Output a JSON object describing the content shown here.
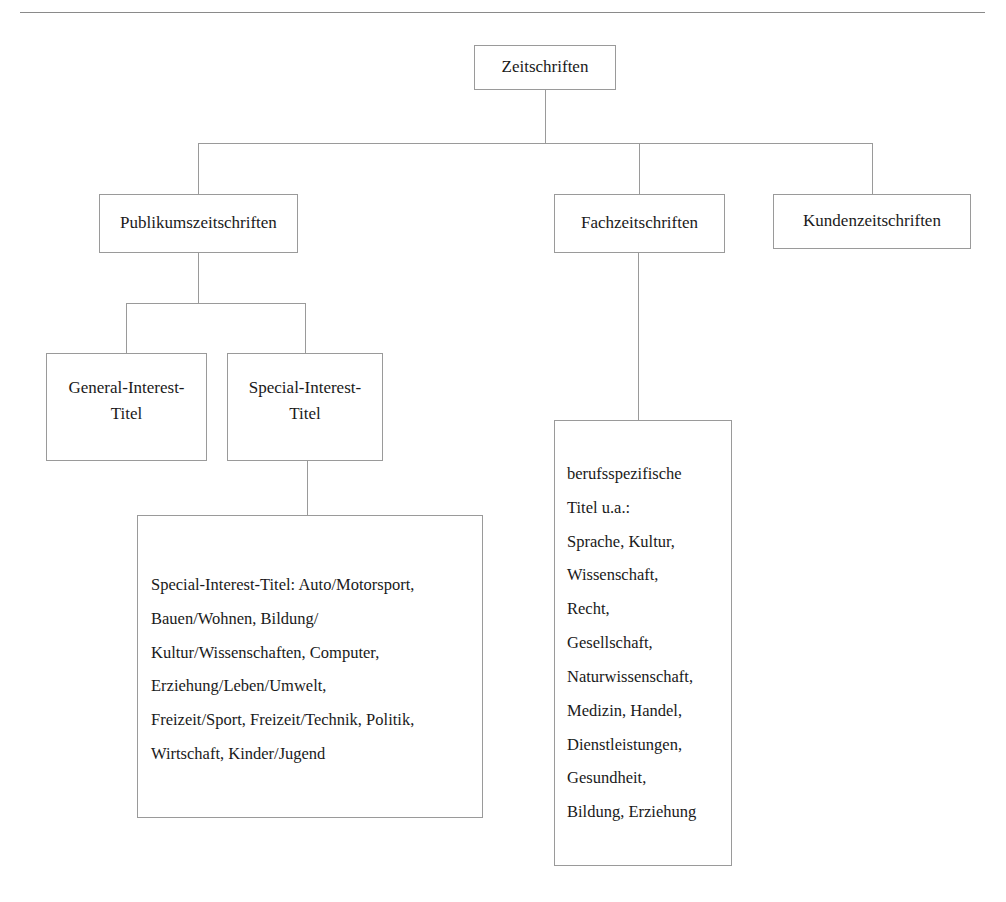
{
  "diagram": {
    "title_node": "Zeitschriften",
    "nodes": {
      "root": {
        "label": "Zeitschriften"
      },
      "publikum": {
        "label": "Publikumszeitschriften"
      },
      "fach": {
        "label": "Fachzeitschriften"
      },
      "kunden": {
        "label": "Kundenzeitschriften"
      },
      "general_interest": {
        "line1": "General-Interest-",
        "line2": "Titel"
      },
      "special_interest": {
        "line1": "Special-Interest-",
        "line2": "Titel"
      },
      "special_interest_detail": {
        "lines": [
          "Special-Interest-Titel: Auto/Motorsport,",
          "Bauen/Wohnen, Bildung/",
          "Kultur/Wissenschaften, Computer,",
          "Erziehung/Leben/Umwelt,",
          "Freizeit/Sport, Freizeit/Technik, Politik,",
          "Wirtschaft, Kinder/Jugend"
        ]
      },
      "fach_detail": {
        "lines": [
          "berufsspezifische",
          "Titel u.a.:",
          "Sprache, Kultur,",
          "Wissenschaft,",
          "Recht,",
          "Gesellschaft,",
          "Naturwissenschaft,",
          "Medizin, Handel,",
          "Dienstleistungen,",
          "Gesundheit,",
          "Bildung, Erziehung"
        ]
      }
    },
    "colors": {
      "border": "#9a9a9a",
      "rule": "#8a8a8a",
      "text": "#1a1a1a",
      "background": "#ffffff"
    }
  }
}
